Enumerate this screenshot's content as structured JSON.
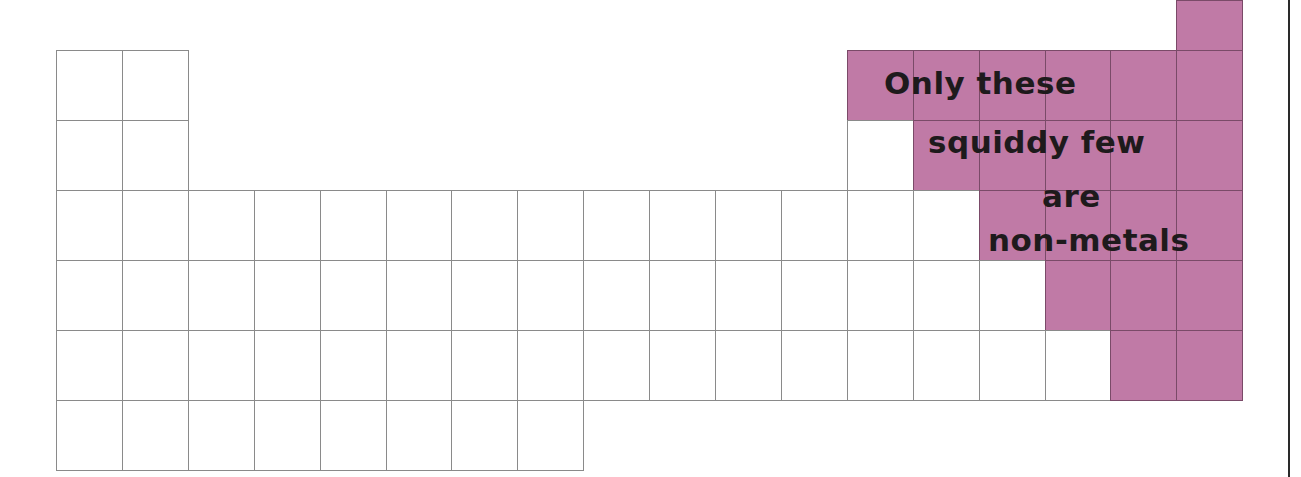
{
  "colors": {
    "nonmetal_fill": "#c07aa6",
    "cell_border": "#8a8a8a",
    "background": "#ffffff",
    "text": "#1e1a1c"
  },
  "grid": {
    "left": 56,
    "col_width": 65.9,
    "rows": [
      {
        "row": 1,
        "top": 0,
        "height": 50,
        "cells": [
          {
            "col": 18,
            "type": "nonmetal"
          }
        ]
      },
      {
        "row": 2,
        "top": 50,
        "height": 70,
        "cells": [
          {
            "col": 1,
            "type": "metal"
          },
          {
            "col": 2,
            "type": "metal"
          },
          {
            "col": 13,
            "type": "nonmetal"
          },
          {
            "col": 14,
            "type": "nonmetal"
          },
          {
            "col": 15,
            "type": "nonmetal"
          },
          {
            "col": 16,
            "type": "nonmetal"
          },
          {
            "col": 17,
            "type": "nonmetal"
          },
          {
            "col": 18,
            "type": "nonmetal"
          }
        ]
      },
      {
        "row": 3,
        "top": 120,
        "height": 70,
        "cells": [
          {
            "col": 1,
            "type": "metal"
          },
          {
            "col": 2,
            "type": "metal"
          },
          {
            "col": 13,
            "type": "metal"
          },
          {
            "col": 14,
            "type": "nonmetal"
          },
          {
            "col": 15,
            "type": "nonmetal"
          },
          {
            "col": 16,
            "type": "nonmetal"
          },
          {
            "col": 17,
            "type": "nonmetal"
          },
          {
            "col": 18,
            "type": "nonmetal"
          }
        ]
      },
      {
        "row": 4,
        "top": 190,
        "height": 70,
        "pink_from": 15,
        "cols": 18
      },
      {
        "row": 5,
        "top": 260,
        "height": 70,
        "pink_from": 16,
        "cols": 18
      },
      {
        "row": 6,
        "top": 330,
        "height": 70,
        "pink_from": 17,
        "cols": 18
      },
      {
        "row": 7,
        "top": 400,
        "height": 70,
        "pink_from": 99,
        "cols": 8
      }
    ]
  },
  "caption": {
    "lines": [
      {
        "text": "Only these",
        "left": 884,
        "top": 65
      },
      {
        "text": "squiddy few",
        "left": 928,
        "top": 124
      },
      {
        "text": "are",
        "left": 1042,
        "top": 178
      },
      {
        "text": "non-metals",
        "left": 988,
        "top": 222
      }
    ]
  }
}
